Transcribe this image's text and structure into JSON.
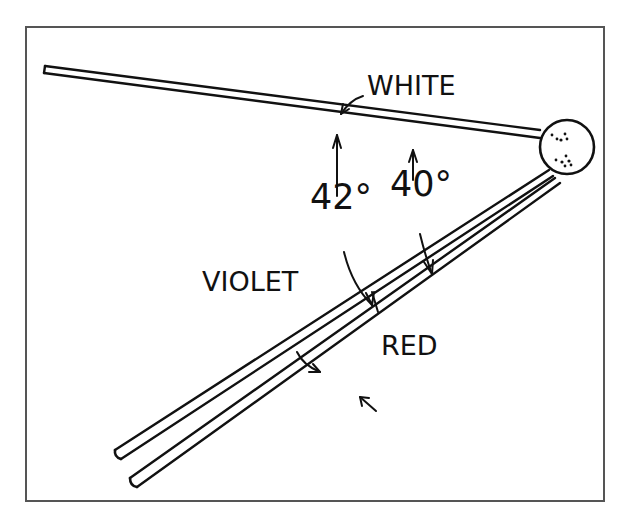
{
  "diagram": {
    "labels": {
      "white": "WHITE",
      "violet": "VIOLET",
      "red": "RED",
      "angle_violet": "42°",
      "angle_red": "40°"
    },
    "colors": {
      "ink": "#111111",
      "frame": "#555555",
      "background": "#ffffff"
    }
  }
}
